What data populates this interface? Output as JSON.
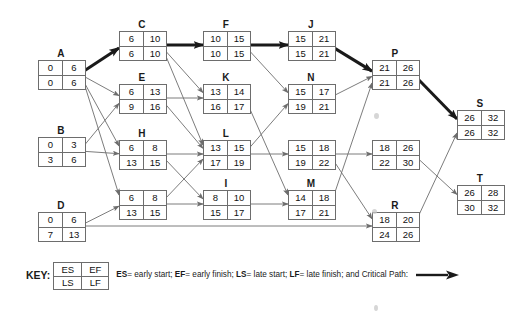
{
  "diagram": {
    "type": "pert-cpm-network",
    "nodes": [
      {
        "id": "A",
        "label": "A",
        "es": 0,
        "ef": 6,
        "ls": 0,
        "lf": 6,
        "x": 38,
        "y": 60,
        "w": 46,
        "h": 28,
        "critical": true
      },
      {
        "id": "B",
        "label": "B",
        "es": 0,
        "ef": 3,
        "ls": 3,
        "lf": 6,
        "x": 38,
        "y": 137,
        "w": 46,
        "h": 28,
        "critical": false
      },
      {
        "id": "D",
        "label": "D",
        "es": 0,
        "ef": 6,
        "ls": 7,
        "lf": 13,
        "x": 38,
        "y": 212,
        "w": 46,
        "h": 28,
        "critical": false
      },
      {
        "id": "C",
        "label": "C",
        "es": 6,
        "ef": 10,
        "ls": 6,
        "lf": 10,
        "x": 119,
        "y": 31,
        "w": 46,
        "h": 28,
        "critical": true
      },
      {
        "id": "E",
        "label": "E",
        "es": 6,
        "ef": 13,
        "ls": 9,
        "lf": 16,
        "x": 119,
        "y": 84,
        "w": 46,
        "h": 28,
        "critical": false
      },
      {
        "id": "H",
        "label": "H",
        "es": 6,
        "ef": 8,
        "ls": 13,
        "lf": 15,
        "x": 119,
        "y": 140,
        "w": 46,
        "h": 28,
        "critical": false
      },
      {
        "id": "G1",
        "label": "",
        "es": 6,
        "ef": 8,
        "ls": 13,
        "lf": 15,
        "x": 119,
        "y": 190,
        "w": 46,
        "h": 28,
        "critical": false
      },
      {
        "id": "F",
        "label": "F",
        "es": 10,
        "ef": 15,
        "ls": 10,
        "lf": 15,
        "x": 203,
        "y": 31,
        "w": 46,
        "h": 28,
        "critical": true
      },
      {
        "id": "K",
        "label": "K",
        "es": 13,
        "ef": 14,
        "ls": 16,
        "lf": 17,
        "x": 203,
        "y": 84,
        "w": 46,
        "h": 28,
        "critical": false
      },
      {
        "id": "L",
        "label": "L",
        "es": 13,
        "ef": 15,
        "ls": 17,
        "lf": 19,
        "x": 203,
        "y": 140,
        "w": 46,
        "h": 28,
        "critical": false
      },
      {
        "id": "I",
        "label": "I",
        "es": 8,
        "ef": 10,
        "ls": 15,
        "lf": 17,
        "x": 203,
        "y": 190,
        "w": 46,
        "h": 28,
        "critical": false
      },
      {
        "id": "J",
        "label": "J",
        "es": 15,
        "ef": 21,
        "ls": 15,
        "lf": 21,
        "x": 288,
        "y": 31,
        "w": 46,
        "h": 28,
        "critical": true
      },
      {
        "id": "N",
        "label": "N",
        "es": 15,
        "ef": 17,
        "ls": 19,
        "lf": 21,
        "x": 288,
        "y": 84,
        "w": 46,
        "h": 28,
        "critical": false
      },
      {
        "id": "G2",
        "label": "",
        "es": 15,
        "ef": 18,
        "ls": 19,
        "lf": 22,
        "x": 288,
        "y": 140,
        "w": 46,
        "h": 28,
        "critical": false
      },
      {
        "id": "M",
        "label": "M",
        "es": 14,
        "ef": 18,
        "ls": 17,
        "lf": 21,
        "x": 288,
        "y": 190,
        "w": 46,
        "h": 28,
        "critical": false
      },
      {
        "id": "P",
        "label": "P",
        "es": 21,
        "ef": 26,
        "ls": 21,
        "lf": 26,
        "x": 372,
        "y": 60,
        "w": 46,
        "h": 28,
        "critical": true
      },
      {
        "id": "G3",
        "label": "",
        "es": 18,
        "ef": 26,
        "ls": 22,
        "lf": 30,
        "x": 372,
        "y": 140,
        "w": 46,
        "h": 28,
        "critical": false
      },
      {
        "id": "R",
        "label": "R",
        "es": 18,
        "ef": 20,
        "ls": 24,
        "lf": 26,
        "x": 372,
        "y": 212,
        "w": 46,
        "h": 28,
        "critical": false
      },
      {
        "id": "S",
        "label": "S",
        "es": 26,
        "ef": 32,
        "ls": 26,
        "lf": 32,
        "x": 457,
        "y": 110,
        "w": 46,
        "h": 28,
        "critical": true
      },
      {
        "id": "T",
        "label": "T",
        "es": 26,
        "ef": 28,
        "ls": 30,
        "lf": 32,
        "x": 457,
        "y": 185,
        "w": 46,
        "h": 28,
        "critical": false
      }
    ],
    "edges": [
      {
        "from": "A",
        "to": "C",
        "critical": true
      },
      {
        "from": "C",
        "to": "F",
        "critical": true
      },
      {
        "from": "F",
        "to": "J",
        "critical": true
      },
      {
        "from": "J",
        "to": "P",
        "critical": true
      },
      {
        "from": "P",
        "to": "S",
        "critical": true
      },
      {
        "from": "A",
        "to": "E",
        "critical": false
      },
      {
        "from": "A",
        "to": "H",
        "critical": false
      },
      {
        "from": "A",
        "to": "G1",
        "critical": false
      },
      {
        "from": "B",
        "to": "E",
        "critical": false
      },
      {
        "from": "B",
        "to": "H",
        "critical": false
      },
      {
        "from": "D",
        "to": "G1",
        "critical": false
      },
      {
        "from": "D",
        "to": "R",
        "critical": false
      },
      {
        "from": "C",
        "to": "K",
        "critical": false
      },
      {
        "from": "C",
        "to": "L",
        "critical": false
      },
      {
        "from": "E",
        "to": "K",
        "critical": false
      },
      {
        "from": "E",
        "to": "L",
        "critical": false
      },
      {
        "from": "H",
        "to": "L",
        "critical": false
      },
      {
        "from": "H",
        "to": "I",
        "critical": false
      },
      {
        "from": "G1",
        "to": "L",
        "critical": false
      },
      {
        "from": "G1",
        "to": "I",
        "critical": false
      },
      {
        "from": "F",
        "to": "N",
        "critical": false
      },
      {
        "from": "K",
        "to": "M",
        "critical": false
      },
      {
        "from": "L",
        "to": "N",
        "critical": false
      },
      {
        "from": "L",
        "to": "G2",
        "critical": false
      },
      {
        "from": "I",
        "to": "M",
        "critical": false
      },
      {
        "from": "N",
        "to": "P",
        "critical": false
      },
      {
        "from": "G2",
        "to": "G3",
        "critical": false
      },
      {
        "from": "G2",
        "to": "R",
        "critical": false
      },
      {
        "from": "M",
        "to": "P",
        "critical": false
      },
      {
        "from": "G3",
        "to": "T",
        "critical": false
      },
      {
        "from": "R",
        "to": "S",
        "critical": false
      }
    ]
  },
  "legend": {
    "key_word": "KEY:",
    "box": {
      "es": "ES",
      "ef": "EF",
      "ls": "LS",
      "lf": "LF"
    },
    "desc_parts": [
      {
        "b": "ES",
        "t": "= early start; "
      },
      {
        "b": "EF",
        "t": "= early finish; "
      },
      {
        "b": "LS",
        "t": "= late start; "
      },
      {
        "b": "LF",
        "t": "= late finish; and Critical Path:  "
      }
    ]
  },
  "colors": {
    "line": "#6d6d6d",
    "critical": "#1a1a1a",
    "border": "#6d6d6d",
    "text": "#111111",
    "background": "#ffffff"
  }
}
